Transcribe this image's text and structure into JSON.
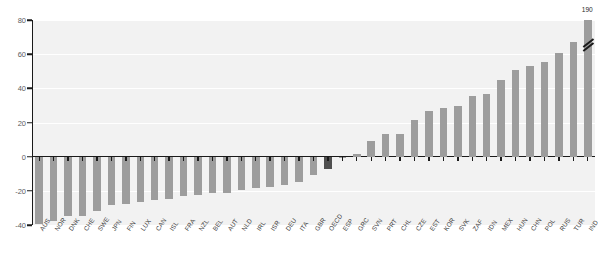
{
  "chart_data": {
    "type": "bar",
    "title": "",
    "xlabel": "",
    "ylabel": "",
    "ylim": [
      -40,
      80
    ],
    "yticks": [
      -40,
      -20,
      0,
      20,
      40,
      60,
      80
    ],
    "grid": true,
    "legend": "none",
    "highlight_category": "OECD",
    "highlight_color": "#4f4f4f",
    "bar_color": "#9d9d9d",
    "plot_background": "#f2f2f2",
    "categories": [
      "AUS",
      "NOR",
      "DNK",
      "CHE",
      "SWE",
      "JPN",
      "FIN",
      "LUX",
      "CAN",
      "ISL",
      "FRA",
      "NZL",
      "BEL",
      "AUT",
      "NLD",
      "IRL",
      "ISR",
      "DEU",
      "ITA",
      "GBR",
      "OECD",
      "ESP",
      "GRC",
      "SVN",
      "PRT",
      "CHL",
      "CZE",
      "EST",
      "KOR",
      "SVK",
      "ZAF",
      "IDN",
      "MEX",
      "HUN",
      "CHN",
      "POL",
      "RUS",
      "TUR",
      "IND"
    ],
    "values": [
      -39.5,
      -37.5,
      -35.0,
      -34.5,
      -32.0,
      -28.5,
      -27.5,
      -26.5,
      -25.5,
      -24.5,
      -23.0,
      -22.5,
      -21.5,
      -21.0,
      -19.5,
      -18.5,
      -17.5,
      -16.5,
      -15.0,
      -10.5,
      -7.5,
      -1.0,
      1.5,
      9.0,
      13.0,
      13.5,
      21.5,
      27.0,
      28.5,
      29.5,
      35.5,
      36.5,
      45.0,
      50.5,
      53.0,
      55.5,
      60.5,
      67.0,
      190.0
    ],
    "annotations": [
      {
        "category": "IND",
        "label": "190",
        "note": "axis-break; bar truncated at top of plot"
      }
    ]
  },
  "axis": {
    "y_tick_labels": [
      "80",
      "60",
      "40",
      "20",
      "0",
      "-20",
      "-40"
    ]
  }
}
